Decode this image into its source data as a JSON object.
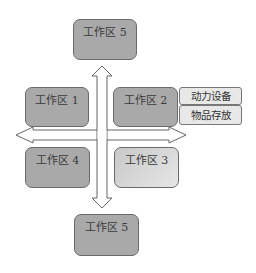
{
  "diagram": {
    "type": "workspace-layout",
    "zones": {
      "top": {
        "label": "工作区 5"
      },
      "upper_left": {
        "label": "工作区 1"
      },
      "upper_right": {
        "label": "工作区 2"
      },
      "lower_left": {
        "label": "工作区 4"
      },
      "lower_right": {
        "label": "工作区 3"
      },
      "bottom": {
        "label": "工作区 5"
      }
    },
    "side_tags": [
      {
        "label": "动力设备"
      },
      {
        "label": "物品存放"
      }
    ],
    "arrows": {
      "vertical": "bidirectional",
      "horizontal": "bidirectional"
    },
    "colors": {
      "box_fill": "#a9a9a9",
      "box_light_fill": "#dcdcdc",
      "tag_fill": "#e8e8e8",
      "outline": "#6a6a6a"
    }
  }
}
